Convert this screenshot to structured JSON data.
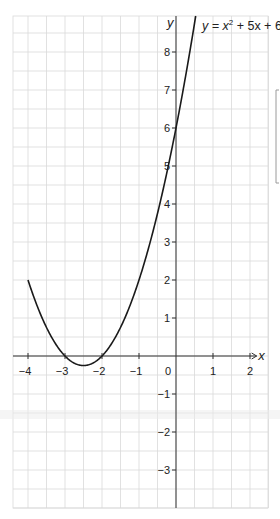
{
  "chart_data": {
    "type": "line",
    "title_parts": {
      "pre": "y = x",
      "sup": "2",
      "post": " + 5x + 6"
    },
    "xlabel": "x",
    "ylabel": "y",
    "xlim": [
      -4.5,
      2.5
    ],
    "ylim": [
      -4.0,
      9.0
    ],
    "grid": true,
    "grid_step": 0.5,
    "x_ticks": [
      -4,
      -3,
      -2,
      -1,
      0,
      1,
      2
    ],
    "x_tick_labels": [
      "−4",
      "−3",
      "−2",
      "−1",
      "0",
      "1",
      "2"
    ],
    "y_ticks": [
      8,
      7,
      6,
      5,
      4,
      3,
      2,
      1,
      -1,
      -2,
      -3
    ],
    "y_tick_labels": [
      "8",
      "7",
      "6",
      "5",
      "4",
      "3",
      "2",
      "1",
      "−1",
      "−2",
      "−3"
    ],
    "series": [
      {
        "name": "y = x² + 5x + 6",
        "function": {
          "a": 1,
          "b": 5,
          "c": 6
        },
        "x_range": [
          -4,
          0.6
        ],
        "x": [
          -4,
          -3.5,
          -3,
          -2.5,
          -2,
          -1.5,
          -1,
          -0.5,
          0,
          0.5
        ],
        "y": [
          2,
          0.75,
          0,
          -0.25,
          0,
          0.75,
          2,
          3.75,
          6,
          8.75
        ]
      }
    ]
  }
}
